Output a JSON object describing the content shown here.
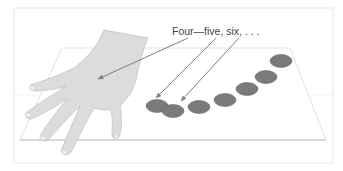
{
  "diagram": {
    "caption": "Four—five, six, . . .",
    "colors": {
      "background": "#ffffff",
      "frame_border": "#e6e6e6",
      "table_fill": "#ffffff",
      "table_edge": "#e2e2e2",
      "table_front_line": "#cfcfcf",
      "hand_fill": "#dcdcdc",
      "hand_stroke": "#c4c4c4",
      "nail_fill": "#f2f2f2",
      "disk_fill": "#7a7a7a",
      "disk_stroke": "#6a6a6a",
      "arrow": "#808080",
      "text": "#444444"
    },
    "disks": [
      {
        "cx": 157,
        "cy": 106
      },
      {
        "cx": 173,
        "cy": 111
      },
      {
        "cx": 199,
        "cy": 107
      },
      {
        "cx": 225,
        "cy": 100
      },
      {
        "cx": 247,
        "cy": 89
      },
      {
        "cx": 266,
        "cy": 77
      },
      {
        "cx": 281,
        "cy": 61
      }
    ],
    "arrows": [
      {
        "label": "four",
        "x1": 188,
        "y1": 38,
        "x2": 98,
        "y2": 79
      },
      {
        "label": "five",
        "x1": 216,
        "y1": 38,
        "x2": 156,
        "y2": 98
      },
      {
        "label": "six",
        "x1": 239,
        "y1": 38,
        "x2": 181,
        "y2": 101
      }
    ]
  }
}
